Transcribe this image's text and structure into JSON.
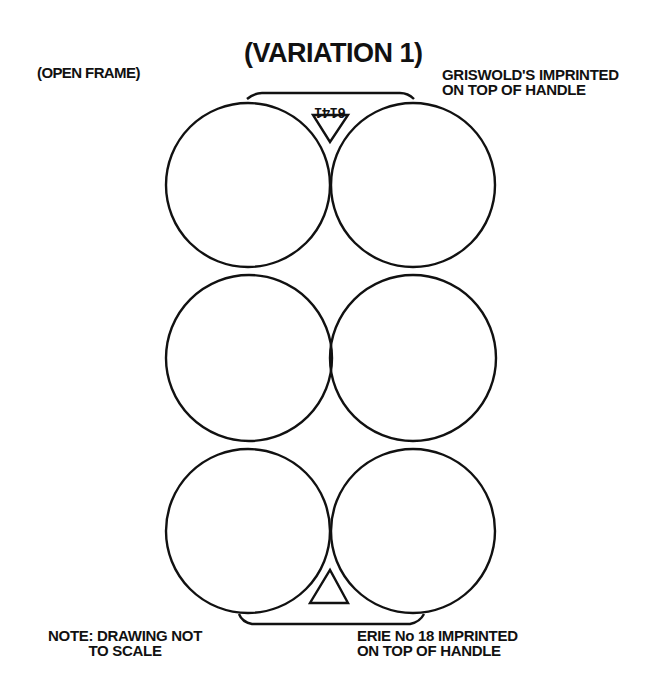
{
  "title": "(VARIATION 1)",
  "labels": {
    "frame_type": "(OPEN FRAME)",
    "top_handle_line1": "GRISWOLD'S IMPRINTED",
    "top_handle_line2": "ON TOP OF HANDLE",
    "scale_note_line1": "NOTE: DRAWING NOT",
    "scale_note_line2": "TO SCALE",
    "bottom_handle_line1": "ERIE No 18 IMPRINTED",
    "bottom_handle_line2": "ON TOP OF HANDLE"
  },
  "drawing": {
    "stroke_color": "#111111",
    "handle_top_marking": "6141",
    "cups": [
      {
        "row": 1,
        "col": 1,
        "cx": 248,
        "cy": 185,
        "r": 82
      },
      {
        "row": 1,
        "col": 2,
        "cx": 413,
        "cy": 185,
        "r": 82
      },
      {
        "row": 2,
        "col": 1,
        "cx": 249,
        "cy": 358,
        "r": 83
      },
      {
        "row": 2,
        "col": 2,
        "cx": 413,
        "cy": 358,
        "r": 83
      },
      {
        "row": 3,
        "col": 1,
        "cx": 248,
        "cy": 531,
        "r": 82
      },
      {
        "row": 3,
        "col": 2,
        "cx": 413,
        "cy": 531,
        "r": 82
      }
    ]
  }
}
